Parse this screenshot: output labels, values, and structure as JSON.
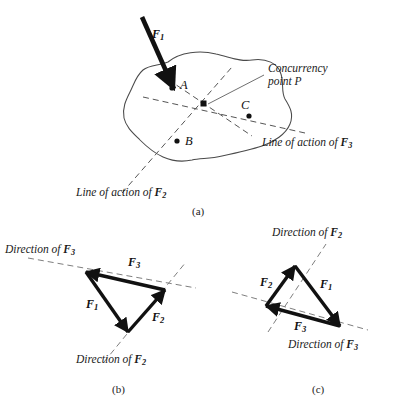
{
  "figure": {
    "captions": [
      {
        "id": "a",
        "text": "(a)",
        "x": 192,
        "y": 206
      },
      {
        "id": "b",
        "text": "(b)",
        "x": 112,
        "y": 385
      },
      {
        "id": "c",
        "text": "(c)",
        "x": 312,
        "y": 385
      }
    ]
  },
  "panel_a": {
    "body_points": [
      {
        "label": "A",
        "dot_x": 172,
        "dot_y": 88,
        "label_x": 180,
        "label_y": 80
      },
      {
        "label": "B",
        "dot_x": 177,
        "dot_y": 141,
        "label_x": 185,
        "label_y": 137
      },
      {
        "label": "C",
        "dot_x": 249,
        "dot_y": 116,
        "label_x": 241,
        "label_y": 100
      }
    ],
    "concurrency": {
      "label_line1": "Concurrency",
      "label_line2": "point P",
      "label_x": 268,
      "label_y": 64,
      "point_x": 204,
      "point_y": 104
    },
    "applied_force": {
      "name": "F",
      "sub": "1",
      "label_x": 152,
      "label_y": 27
    },
    "line_labels": [
      {
        "prefix": "Line of action of ",
        "name": "F",
        "sub": "3",
        "x": 262,
        "y": 137
      },
      {
        "prefix": "Line of action of ",
        "name": "F",
        "sub": "2",
        "x": 76,
        "y": 188
      }
    ]
  },
  "panel_b": {
    "force_labels": [
      {
        "name": "F",
        "sub": "3",
        "x": 128,
        "y": 261
      },
      {
        "name": "F",
        "sub": "1",
        "x": 90,
        "y": 303
      },
      {
        "name": "F",
        "sub": "2",
        "x": 152,
        "y": 316
      }
    ],
    "direction_labels": [
      {
        "prefix": "Direction of ",
        "name": "F",
        "sub": "3",
        "x": 5,
        "y": 248
      },
      {
        "prefix": "Direction of ",
        "name": "F",
        "sub": "2",
        "x": 76,
        "y": 358
      }
    ]
  },
  "panel_c": {
    "force_labels": [
      {
        "name": "F",
        "sub": "2",
        "x": 262,
        "y": 281
      },
      {
        "name": "F",
        "sub": "1",
        "x": 322,
        "y": 283
      },
      {
        "name": "F",
        "sub": "3",
        "x": 296,
        "y": 325
      }
    ],
    "direction_labels": [
      {
        "prefix": "Direction of ",
        "name": "F",
        "sub": "2",
        "x": 272,
        "y": 228
      },
      {
        "prefix": "Direction of ",
        "name": "F",
        "sub": "3",
        "x": 298,
        "y": 340
      }
    ]
  },
  "colors": {
    "ink": "#111111",
    "outline": "#4a4a4a",
    "dashed": "#555555",
    "background": "#ffffff"
  }
}
